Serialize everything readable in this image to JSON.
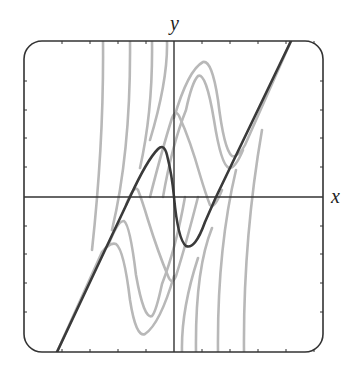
{
  "chart_data": {
    "type": "line",
    "title": "",
    "xlabel": "x",
    "ylabel": "y",
    "grid": false,
    "legend": null,
    "frame": {
      "left": 24,
      "top": 41,
      "right": 323,
      "bottom": 352,
      "corner_radius": 18
    },
    "origin_px": {
      "x": 174,
      "y": 197
    },
    "tick_spacing_px": {
      "x": 28,
      "y": 28.7
    },
    "x_ticks_px": [
      62,
      90,
      118,
      146,
      202,
      230,
      258,
      286,
      314
    ],
    "y_ticks_px": [
      81,
      110,
      138,
      167,
      226,
      254,
      283,
      312
    ],
    "xlim_units": [
      -5.4,
      5.3
    ],
    "ylim_units": [
      -5.4,
      5.4
    ],
    "colors": {
      "highlight": "#3a3a3a",
      "family": "#b8b8b8",
      "axes": "#333333"
    },
    "series": [
      {
        "name": "highlighted-solution",
        "style": "dark",
        "path": "M57,352 L130,197 Q147,160 158,149 Q164,143 167,155 Q172,175 174,197 Q178,240 186,246 Q195,250 205,222 L216,197 L291,41"
      },
      {
        "name": "family-top-1",
        "style": "gray",
        "path": "M174,118 Q188,70 203,62 Q212,60 218,100 Q224,150 232,156 Q238,158 245,145 L291,41"
      },
      {
        "name": "family-top-2",
        "style": "gray",
        "path": "M163,197 Q172,145 186,110 Q192,82 198,76 Q206,72 214,120 Q221,165 229,168 Q235,169 243,150"
      },
      {
        "name": "family-top-3",
        "style": "gray",
        "path": "M150,197 Q162,150 172,118 Q176,108 180,118 Q190,140 200,175 Q206,195 210,205 Q214,210 222,190"
      },
      {
        "name": "family-bottom-1",
        "style": "gray",
        "path": "M174,276 Q160,324 145,334 Q136,338 130,300 Q124,250 116,244 Q110,242 102,252 L57,352"
      },
      {
        "name": "family-bottom-2",
        "style": "gray",
        "path": "M185,197 Q176,248 162,284 Q156,312 152,316 Q144,320 136,275 Q130,225 124,221 Q118,220 108,246"
      },
      {
        "name": "family-bottom-3",
        "style": "gray",
        "path": "M198,197 Q186,244 176,276 Q172,286 168,276 Q158,252 148,220 Q142,200 138,190 Q134,184 126,205"
      },
      {
        "name": "asymptote-left-1",
        "style": "gray",
        "path": "M103,41 Q104,140 92,250"
      },
      {
        "name": "asymptote-left-2",
        "style": "gray",
        "path": "M130,41 Q131,150 112,230"
      },
      {
        "name": "asymptote-left-3",
        "style": "gray",
        "path": "M152,41 Q153,110 140,168"
      },
      {
        "name": "asymptote-left-4",
        "style": "gray",
        "path": "M167,41 Q168,80 150,140"
      },
      {
        "name": "asymptote-right-1",
        "style": "gray",
        "path": "M182,352 Q181,310 198,258"
      },
      {
        "name": "asymptote-right-2",
        "style": "gray",
        "path": "M196,352 Q195,270 212,228"
      },
      {
        "name": "asymptote-right-3",
        "style": "gray",
        "path": "M218,352 Q217,250 236,170"
      },
      {
        "name": "asymptote-right-4",
        "style": "gray",
        "path": "M244,352 Q243,240 262,130"
      }
    ],
    "annotations": []
  },
  "labels": {
    "x_axis": "x",
    "y_axis": "y"
  }
}
